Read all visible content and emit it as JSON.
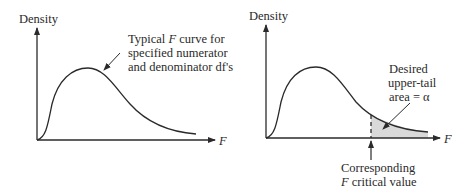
{
  "left_panel": {
    "y_axis_label": "Density",
    "x_axis_label": "F",
    "annotation": {
      "line1_pre": "Typical ",
      "line1_italic": "F",
      "line1_post": " curve for",
      "line2": "specified numerator",
      "line3": "and denominator df's"
    }
  },
  "right_panel": {
    "y_axis_label": "Density",
    "x_axis_label": "F",
    "tail_annotation": {
      "line1": "Desired",
      "line2": "upper-tail",
      "line3": "area = α"
    },
    "critical_annotation": {
      "line1": "Corresponding",
      "line2_italic": "F",
      "line2_post": " critical value"
    }
  },
  "colors": {
    "ink": "#2a2a2a",
    "shade": "#d9d9d9"
  }
}
